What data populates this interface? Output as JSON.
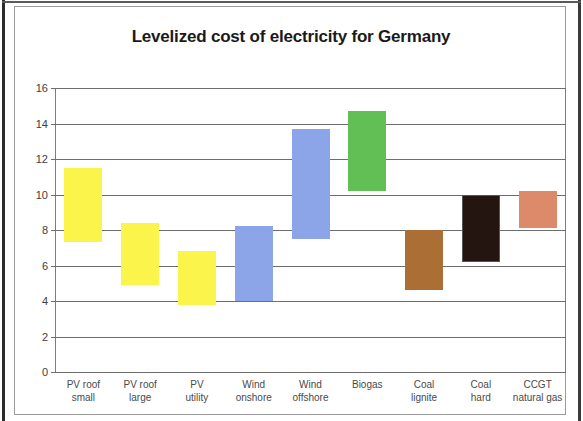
{
  "chart": {
    "title": "Levelized cost of electricity for Germany",
    "ylabel": "",
    "xlabel": ""
  },
  "chart_data": {
    "type": "bar",
    "subtype": "floating-range-bar",
    "title": "Levelized cost of electricity for Germany",
    "xlabel": "",
    "ylabel": "",
    "ylim": [
      0,
      16
    ],
    "ytick_step": 2,
    "yticks": [
      0,
      2,
      4,
      6,
      8,
      10,
      12,
      14,
      16
    ],
    "grid": true,
    "legend": "none",
    "categories": [
      "PV roof small",
      "PV roof large",
      "PV utility",
      "Wind onshore",
      "Wind offshore",
      "Biogas",
      "Coal lignite",
      "Coal hard",
      "CCGT natural gas"
    ],
    "series": [
      {
        "name": "Low estimate",
        "values": [
          7.3,
          4.9,
          3.8,
          4.0,
          7.5,
          10.2,
          4.6,
          6.2,
          8.1
        ]
      },
      {
        "name": "High estimate",
        "values": [
          11.5,
          8.4,
          6.8,
          8.2,
          13.7,
          14.7,
          8.0,
          10.0,
          10.2
        ]
      }
    ],
    "bar_colors": [
      "#fbf44a",
      "#fbf44a",
      "#fbf44a",
      "#8ca5e8",
      "#8ca5e8",
      "#62bf56",
      "#ab6f35",
      "#241510",
      "#dd8a6a"
    ]
  },
  "axis": {
    "tick_labels": [
      "16",
      "14",
      "12",
      "10",
      "8",
      "6",
      "4",
      "2",
      "0"
    ],
    "tick_values": [
      16,
      14,
      12,
      10,
      8,
      6,
      4,
      2,
      0
    ]
  }
}
